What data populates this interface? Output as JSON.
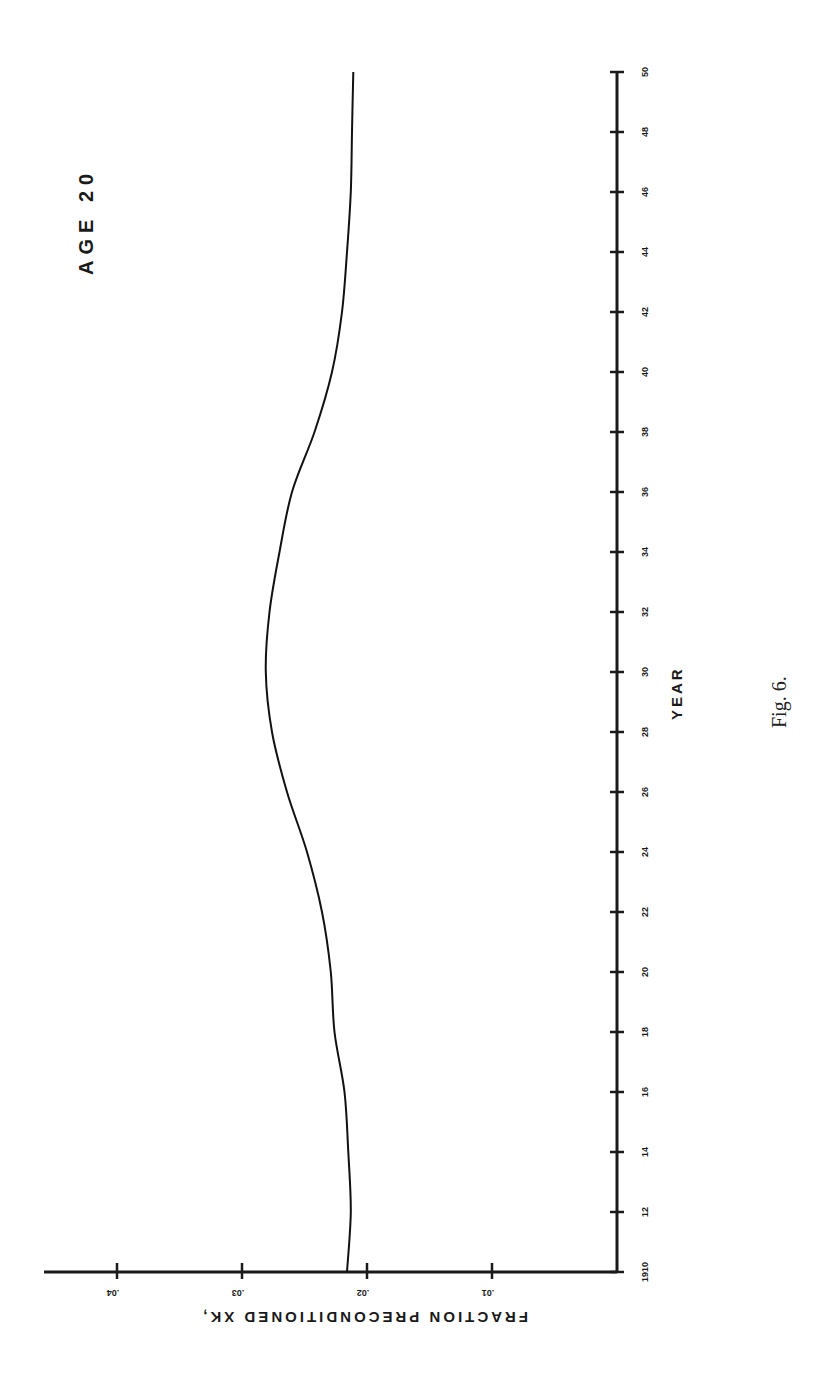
{
  "page": {
    "caption": "Fig. 6.",
    "orientation": "rotated 90 degrees clockwise"
  },
  "chart_data": {
    "type": "line",
    "title": "AGE 20",
    "xlabel": "YEAR",
    "ylabel": "FRACTION PRECONDITIONED XK,",
    "x_tick_labels": [
      "1910",
      "12",
      "14",
      "16",
      "18",
      "20",
      "22",
      "24",
      "26",
      "28",
      "30",
      "32",
      "34",
      "36",
      "38",
      "40",
      "42",
      "44",
      "46",
      "48",
      "50"
    ],
    "y_tick_labels": [
      ".01",
      ".02",
      ".03",
      ".04"
    ],
    "y_ticks": [
      0.01,
      0.02,
      0.03,
      0.04
    ],
    "xlim": [
      1910,
      1950
    ],
    "ylim": [
      0,
      0.046
    ],
    "grid": false,
    "legend": null,
    "series": [
      {
        "name": "Age 20",
        "x": [
          1910,
          1912,
          1914,
          1916,
          1918,
          1920,
          1922,
          1924,
          1926,
          1928,
          1930,
          1932,
          1934,
          1936,
          1938,
          1940,
          1942,
          1944,
          1946,
          1948,
          1950
        ],
        "values": [
          0.0216,
          0.0213,
          0.0215,
          0.0218,
          0.0226,
          0.0229,
          0.0236,
          0.0248,
          0.0264,
          0.0276,
          0.0281,
          0.0278,
          0.027,
          0.026,
          0.0242,
          0.0228,
          0.022,
          0.0216,
          0.0213,
          0.0212,
          0.0211
        ]
      }
    ]
  }
}
